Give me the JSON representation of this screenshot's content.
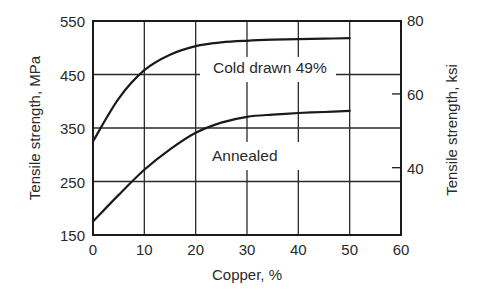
{
  "chart_data": {
    "type": "line",
    "title": "",
    "xlabel": "Copper, %",
    "ylabel": "Tensile strength, MPa",
    "ylabel_right": "Tensile strength, ksi",
    "xlim": [
      0,
      60
    ],
    "ylim": [
      150,
      550
    ],
    "xticks": [
      0,
      10,
      20,
      30,
      40,
      50,
      60
    ],
    "yticks": [
      150,
      250,
      350,
      450,
      550
    ],
    "yticks_right": [
      40,
      60,
      80
    ],
    "grid": true,
    "legend": "inline labels",
    "x": [
      0,
      5,
      10,
      15,
      20,
      25,
      30,
      35,
      40,
      45,
      50
    ],
    "series": [
      {
        "name": "Cold drawn 49%",
        "values": [
          325,
          405,
          458,
          487,
          503,
          510,
          513,
          515,
          516,
          517,
          518
        ]
      },
      {
        "name": "Annealed",
        "values": [
          175,
          225,
          272,
          310,
          341,
          360,
          371,
          375,
          378,
          380,
          382
        ]
      }
    ]
  }
}
